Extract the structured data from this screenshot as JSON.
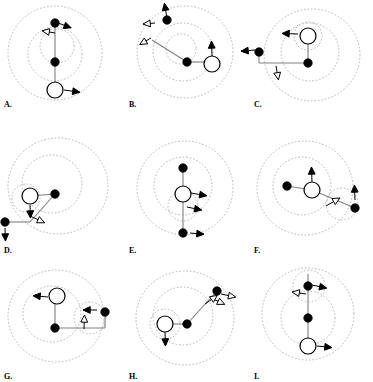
{
  "figure": {
    "type": "multi-panel-diagram",
    "panel_count": 9,
    "columns": 3,
    "rows": 3,
    "background_color": "#ffffff",
    "stroke_color": "#000000",
    "link_color": "#808080",
    "orbit_color": "#b9b9b9",
    "orbit_style": "dotted",
    "node_filled_color": "#000000",
    "node_open_fill": "#ffffff"
  },
  "legend": {
    "filled_node": "filled-circle-node",
    "open_node": "open-circle-node",
    "arrow": "velocity-arrow",
    "orbit": "dotted-orbit-contour",
    "link": "connector-line"
  },
  "panels": [
    {
      "id": "A",
      "label": "A.",
      "label_x": 4,
      "label_y": 100,
      "orbits": [
        {
          "cx": 55,
          "cy": 53,
          "rx": 47,
          "ry": 47
        },
        {
          "cx": 55,
          "cy": 54,
          "rx": 27,
          "ry": 27
        },
        {
          "cx": 57,
          "cy": 46,
          "rx": 17,
          "ry": 17
        }
      ],
      "links": [
        {
          "x1": 55,
          "y1": 23,
          "x2": 55,
          "y2": 90
        }
      ],
      "nodes": [
        {
          "type": "filled",
          "x": 55,
          "y": 23,
          "r": 4.2
        },
        {
          "type": "filled",
          "x": 55,
          "y": 62,
          "r": 4.2
        },
        {
          "type": "open",
          "x": 55,
          "y": 90,
          "r": 8.0
        }
      ],
      "arrows": [
        {
          "x": 58,
          "y": 23,
          "angle": 20,
          "len": 14,
          "style": "solid"
        },
        {
          "x": 55,
          "y": 33,
          "angle": 190,
          "len": 13,
          "style": "open"
        },
        {
          "x": 64,
          "y": 90,
          "angle": 8,
          "len": 16,
          "style": "solid"
        }
      ]
    },
    {
      "id": "B",
      "label": "B.",
      "label_x": 4,
      "label_y": 100,
      "orbits": [
        {
          "cx": 60,
          "cy": 52,
          "rx": 48,
          "ry": 46
        },
        {
          "cx": 58,
          "cy": 52,
          "rx": 30,
          "ry": 29
        },
        {
          "cx": 56,
          "cy": 49,
          "rx": 15,
          "ry": 15
        }
      ],
      "links": [
        {
          "x1": 27,
          "y1": 40,
          "x2": 62,
          "y2": 62
        },
        {
          "x1": 62,
          "y1": 62,
          "x2": 87,
          "y2": 62
        }
      ],
      "nodes": [
        {
          "type": "filled",
          "x": 62,
          "y": 62,
          "r": 4.2
        },
        {
          "type": "open",
          "x": 87,
          "y": 64,
          "r": 8.0
        },
        {
          "type": "filled",
          "x": 42,
          "y": 20,
          "r": 4.2
        }
      ],
      "arrows": [
        {
          "x": 42,
          "y": 18,
          "angle": -100,
          "len": 15,
          "style": "solid"
        },
        {
          "x": 30,
          "y": 23,
          "angle": 175,
          "len": 12,
          "style": "open"
        },
        {
          "x": 26,
          "y": 38,
          "angle": 150,
          "len": 13,
          "style": "open"
        },
        {
          "x": 87,
          "y": 56,
          "angle": -92,
          "len": 15,
          "style": "solid"
        }
      ]
    },
    {
      "id": "C",
      "label": "C.",
      "label_x": 4,
      "label_y": 100,
      "orbits": [
        {
          "cx": 62,
          "cy": 55,
          "rx": 48,
          "ry": 46
        },
        {
          "cx": 60,
          "cy": 52,
          "rx": 29,
          "ry": 29
        },
        {
          "cx": 58,
          "cy": 36,
          "rx": 14,
          "ry": 14
        }
      ],
      "links": [
        {
          "x1": 9,
          "y1": 52,
          "x2": 9,
          "y2": 63
        },
        {
          "x1": 9,
          "y1": 63,
          "x2": 58,
          "y2": 63
        },
        {
          "x1": 58,
          "y1": 63,
          "x2": 58,
          "y2": 38
        }
      ],
      "nodes": [
        {
          "type": "filled",
          "x": 9,
          "y": 52,
          "r": 4.2
        },
        {
          "type": "filled",
          "x": 58,
          "y": 63,
          "r": 4.2
        },
        {
          "type": "open",
          "x": 58,
          "y": 36,
          "r": 8.0
        }
      ],
      "arrows": [
        {
          "x": 5,
          "y": 50,
          "angle": 175,
          "len": 14,
          "style": "solid"
        },
        {
          "x": 26,
          "y": 66,
          "angle": 80,
          "len": 14,
          "style": "open"
        },
        {
          "x": 48,
          "y": 34,
          "angle": 182,
          "len": 16,
          "style": "solid"
        }
      ]
    },
    {
      "id": "D",
      "label": "D.",
      "label_x": 4,
      "label_y": 118,
      "orbits": [
        {
          "cx": 58,
          "cy": 58,
          "rx": 50,
          "ry": 48
        },
        {
          "cx": 52,
          "cy": 56,
          "rx": 30,
          "ry": 29
        },
        {
          "cx": 26,
          "cy": 70,
          "rx": 14,
          "ry": 14
        }
      ],
      "links": [
        {
          "x1": 5,
          "y1": 94,
          "x2": 30,
          "y2": 94
        },
        {
          "x1": 30,
          "y1": 94,
          "x2": 55,
          "y2": 66
        },
        {
          "x1": 30,
          "y1": 68,
          "x2": 55,
          "y2": 66
        }
      ],
      "nodes": [
        {
          "type": "filled",
          "x": 55,
          "y": 66,
          "r": 4.2
        },
        {
          "type": "open",
          "x": 30,
          "y": 68,
          "r": 8.0
        },
        {
          "type": "filled",
          "x": 5,
          "y": 94,
          "r": 4.2
        }
      ],
      "arrows": [
        {
          "x": 30,
          "y": 77,
          "angle": 88,
          "len": 13,
          "style": "solid"
        },
        {
          "x": 5,
          "y": 100,
          "angle": 88,
          "len": 13,
          "style": "solid"
        },
        {
          "x": 30,
          "y": 88,
          "angle": 25,
          "len": 16,
          "style": "open"
        }
      ]
    },
    {
      "id": "E",
      "label": "E.",
      "label_x": 4,
      "label_y": 118,
      "orbits": [
        {
          "cx": 60,
          "cy": 60,
          "rx": 48,
          "ry": 47
        },
        {
          "cx": 58,
          "cy": 58,
          "rx": 29,
          "ry": 29
        },
        {
          "cx": 58,
          "cy": 78,
          "rx": 15,
          "ry": 15
        }
      ],
      "links": [
        {
          "x1": 58,
          "y1": 40,
          "x2": 58,
          "y2": 105
        }
      ],
      "nodes": [
        {
          "type": "filled",
          "x": 58,
          "y": 40,
          "r": 4.2
        },
        {
          "type": "open",
          "x": 58,
          "y": 66,
          "r": 8.0
        },
        {
          "type": "filled",
          "x": 58,
          "y": 105,
          "r": 4.2
        }
      ],
      "arrows": [
        {
          "x": 66,
          "y": 65,
          "angle": 10,
          "len": 16,
          "style": "solid"
        },
        {
          "x": 62,
          "y": 79,
          "angle": 12,
          "len": 15,
          "style": "solid"
        },
        {
          "x": 65,
          "y": 105,
          "angle": 5,
          "len": 14,
          "style": "solid"
        }
      ]
    },
    {
      "id": "F",
      "label": "F.",
      "label_x": 4,
      "label_y": 118,
      "orbits": [
        {
          "cx": 55,
          "cy": 60,
          "rx": 48,
          "ry": 47
        },
        {
          "cx": 52,
          "cy": 58,
          "rx": 29,
          "ry": 29
        },
        {
          "cx": 92,
          "cy": 76,
          "rx": 16,
          "ry": 16
        }
      ],
      "links": [
        {
          "x1": 37,
          "y1": 58,
          "x2": 62,
          "y2": 62
        },
        {
          "x1": 62,
          "y1": 62,
          "x2": 105,
          "y2": 80
        }
      ],
      "nodes": [
        {
          "type": "filled",
          "x": 37,
          "y": 58,
          "r": 4.2
        },
        {
          "type": "open",
          "x": 62,
          "y": 62,
          "r": 8.0
        },
        {
          "type": "filled",
          "x": 105,
          "y": 80,
          "r": 4.2
        }
      ],
      "arrows": [
        {
          "x": 62,
          "y": 54,
          "angle": -92,
          "len": 15,
          "style": "solid"
        },
        {
          "x": 105,
          "y": 72,
          "angle": -92,
          "len": 15,
          "style": "solid"
        },
        {
          "x": 76,
          "y": 78,
          "angle": -30,
          "len": 16,
          "style": "open"
        }
      ]
    },
    {
      "id": "G",
      "label": "G.",
      "label_x": 4,
      "label_y": 116,
      "orbits": [
        {
          "cx": 56,
          "cy": 60,
          "rx": 48,
          "ry": 46
        },
        {
          "cx": 52,
          "cy": 58,
          "rx": 29,
          "ry": 28
        },
        {
          "cx": 90,
          "cy": 62,
          "rx": 16,
          "ry": 16
        }
      ],
      "links": [
        {
          "x1": 55,
          "y1": 42,
          "x2": 55,
          "y2": 72
        },
        {
          "x1": 55,
          "y1": 72,
          "x2": 105,
          "y2": 72
        },
        {
          "x1": 105,
          "y1": 72,
          "x2": 105,
          "y2": 57
        }
      ],
      "nodes": [
        {
          "type": "filled",
          "x": 55,
          "y": 72,
          "r": 4.2
        },
        {
          "type": "open",
          "x": 57,
          "y": 40,
          "r": 8.0
        },
        {
          "type": "filled",
          "x": 105,
          "y": 56,
          "r": 4.2
        }
      ],
      "arrows": [
        {
          "x": 48,
          "y": 41,
          "angle": 185,
          "len": 15,
          "style": "solid"
        },
        {
          "x": 97,
          "y": 54,
          "angle": 180,
          "len": 14,
          "style": "solid"
        },
        {
          "x": 84,
          "y": 73,
          "angle": -88,
          "len": 14,
          "style": "open"
        }
      ]
    },
    {
      "id": "H",
      "label": "H.",
      "label_x": 4,
      "label_y": 116,
      "orbits": [
        {
          "cx": 60,
          "cy": 62,
          "rx": 49,
          "ry": 47
        },
        {
          "cx": 58,
          "cy": 60,
          "rx": 30,
          "ry": 29
        },
        {
          "cx": 40,
          "cy": 68,
          "rx": 15,
          "ry": 15
        }
      ],
      "links": [
        {
          "x1": 40,
          "y1": 68,
          "x2": 62,
          "y2": 68
        },
        {
          "x1": 62,
          "y1": 68,
          "x2": 92,
          "y2": 35
        }
      ],
      "nodes": [
        {
          "type": "filled",
          "x": 62,
          "y": 68,
          "r": 4.2
        },
        {
          "type": "open",
          "x": 40,
          "y": 68,
          "r": 8.0
        },
        {
          "type": "filled",
          "x": 92,
          "y": 35,
          "r": 4.2
        }
      ],
      "arrows": [
        {
          "x": 40,
          "y": 76,
          "angle": 88,
          "len": 14,
          "style": "solid"
        },
        {
          "x": 96,
          "y": 38,
          "angle": 12,
          "len": 15,
          "style": "open"
        },
        {
          "x": 86,
          "y": 42,
          "angle": 25,
          "len": 15,
          "style": "open"
        },
        {
          "x": 80,
          "y": 48,
          "angle": -35,
          "len": 15,
          "style": "open"
        }
      ]
    },
    {
      "id": "I",
      "label": "I.",
      "label_x": 4,
      "label_y": 116,
      "orbits": [
        {
          "cx": 58,
          "cy": 58,
          "rx": 46,
          "ry": 46
        },
        {
          "cx": 58,
          "cy": 62,
          "rx": 27,
          "ry": 27
        },
        {
          "cx": 59,
          "cy": 30,
          "rx": 16,
          "ry": 16
        }
      ],
      "links": [
        {
          "x1": 58,
          "y1": 18,
          "x2": 58,
          "y2": 90
        }
      ],
      "nodes": [
        {
          "type": "filled",
          "x": 58,
          "y": 30,
          "r": 4.2
        },
        {
          "type": "filled",
          "x": 58,
          "y": 62,
          "r": 4.2
        },
        {
          "type": "open",
          "x": 58,
          "y": 90,
          "r": 8.0
        }
      ],
      "arrows": [
        {
          "x": 62,
          "y": 29,
          "angle": 12,
          "len": 15,
          "style": "solid"
        },
        {
          "x": 56,
          "y": 38,
          "angle": 188,
          "len": 14,
          "style": "open"
        },
        {
          "x": 67,
          "y": 90,
          "angle": 6,
          "len": 15,
          "style": "solid"
        }
      ]
    }
  ]
}
